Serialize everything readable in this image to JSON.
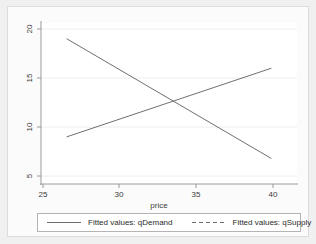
{
  "chart_data": {
    "type": "line",
    "title": "",
    "xlabel": "price",
    "ylabel": "",
    "xlim": [
      25,
      40
    ],
    "ylim": [
      4.2,
      20.6
    ],
    "xticks": [
      25,
      30,
      35,
      40
    ],
    "yticks": [
      5,
      10,
      15,
      20
    ],
    "grid": true,
    "legend_position": "bottom",
    "series": [
      {
        "name": "Fitted values: qDemand",
        "style": "solid",
        "color": "#6f6f6f",
        "x": [
          26.5,
          38.5
        ],
        "values": [
          19.0,
          6.8
        ]
      },
      {
        "name": "Fitted values: qSupply",
        "style": "dashed",
        "color": "#6f6f6f",
        "x": [
          26.5,
          38.5
        ],
        "values": [
          9.0,
          16.0
        ]
      }
    ],
    "equilibrium": {
      "price": 33.2,
      "quantity": 12.4
    }
  },
  "axes": {
    "x_title": "price",
    "x_tick_labels": [
      "25",
      "30",
      "35",
      "40"
    ],
    "y_tick_labels": [
      "5",
      "10",
      "15",
      "20"
    ]
  },
  "legend": {
    "entries": [
      {
        "label": "Fitted values:  qDemand",
        "key": "solid-line-key"
      },
      {
        "label": "Fitted values:  qSupply",
        "key": "dashed-line-key"
      }
    ]
  },
  "colors": {
    "page_background": "#f0f0f0",
    "graph_background": "#fbfbfb",
    "plot_background": "#ffffff",
    "line": "#6f6f6f",
    "axis": "#9a9a9a",
    "grid": "#eceef0",
    "text": "#3b3b3b"
  }
}
